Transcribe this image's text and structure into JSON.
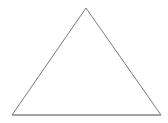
{
  "canvas": {
    "width": 168,
    "height": 123,
    "background_color": "#ffffff",
    "alt_text": "Triangle"
  },
  "figure": {
    "name": "triangle",
    "shape_type": "triangle",
    "classification": "isosceles-triangle",
    "fill": "none",
    "fill_color": "#ffffff",
    "stroke_color": "#7a7a7a",
    "baseline_stroke_color": "#8a8a8a",
    "stroke_width": 1,
    "label": "",
    "vertices": [
      {
        "name": "apex",
        "x": 86,
        "y": 8
      },
      {
        "name": "bottom-right",
        "x": 161,
        "y": 115
      },
      {
        "name": "bottom-left",
        "x": 12,
        "y": 115
      }
    ],
    "points_attr": "86,8 161,115 12,115",
    "edges": [
      {
        "name": "left-edge",
        "from": "apex",
        "to": "bottom-left"
      },
      {
        "name": "right-edge",
        "from": "apex",
        "to": "bottom-right"
      },
      {
        "name": "base-edge",
        "from": "bottom-left",
        "to": "bottom-right"
      }
    ],
    "base_line": {
      "x1": 12,
      "y1": 115,
      "x2": 161,
      "y2": 115
    },
    "measurements": {
      "base_length_px": 149,
      "height_px": 107,
      "apex_offset_from_base_center_px": 0
    }
  }
}
